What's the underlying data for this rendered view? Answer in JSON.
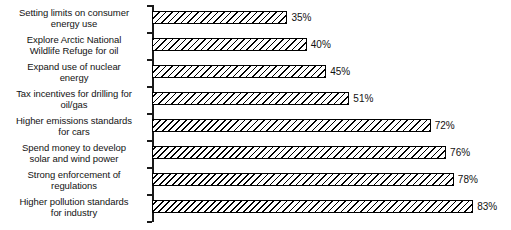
{
  "chart_data": {
    "type": "bar",
    "orientation": "horizontal",
    "title": "",
    "subtitle": "",
    "xlabel": "",
    "ylabel": "",
    "xlim": [
      0,
      100
    ],
    "grid": false,
    "legend": null,
    "value_suffix": "%",
    "categories": [
      "Setting limits on consumer\nenergy use",
      "Explore Arctic National\nWildlife Refuge for oil",
      "Expand use of nuclear\nenergy",
      "Tax incentives for drilling for\noil/gas",
      "Higher emissions standards\nfor cars",
      "Spend money to develop\nsolar and wind power",
      "Strong enforcement of\nregulations",
      "Higher pollution standards\nfor industry"
    ],
    "values": [
      35,
      40,
      45,
      51,
      72,
      76,
      78,
      83
    ],
    "data_labels": [
      "35%",
      "40%",
      "45%",
      "51%",
      "72%",
      "76%",
      "78%",
      "83%"
    ],
    "series": [
      {
        "name": "",
        "values": [
          35,
          40,
          45,
          51,
          72,
          76,
          78,
          83
        ]
      }
    ],
    "bar_fill": "diagonal-hatch",
    "bar_border_color": "#000000",
    "bar_fill_color": "#ffffff"
  }
}
